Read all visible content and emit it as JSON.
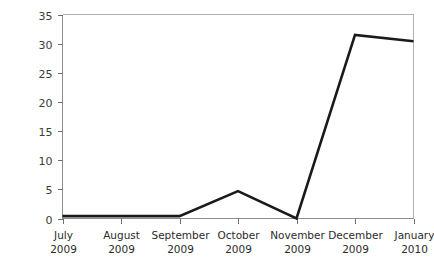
{
  "chart_data": {
    "type": "line",
    "title": "",
    "xlabel": "",
    "ylabel": "",
    "categories": [
      "July 2009",
      "August 2009",
      "September 2009",
      "October 2009",
      "November 2009",
      "December 2009",
      "January 2010"
    ],
    "category_lines": [
      [
        "July",
        "2009"
      ],
      [
        "August",
        "2009"
      ],
      [
        "September",
        "2009"
      ],
      [
        "October",
        "2009"
      ],
      [
        "November",
        "2009"
      ],
      [
        "December",
        "2009"
      ],
      [
        "January",
        "2010"
      ]
    ],
    "values": [
      0.4,
      0.4,
      0.4,
      4.7,
      0,
      31.5,
      30.4
    ],
    "ylim": [
      0,
      35
    ],
    "ytick_labels": [
      "0",
      "5",
      "10",
      "15",
      "20",
      "25",
      "30",
      "35"
    ],
    "ytick_values": [
      0,
      5,
      10,
      15,
      20,
      25,
      30,
      35
    ],
    "grid": false,
    "legend": false,
    "legend_position": "none",
    "series_color": "#1a1a1a",
    "frame_color": "#b0b0b0",
    "label_color": "#2b2b2b"
  }
}
